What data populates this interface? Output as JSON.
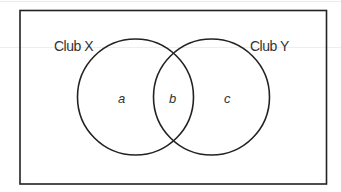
{
  "diagram": {
    "type": "venn",
    "universe_box": {
      "stroke": "#222222"
    },
    "sets": [
      {
        "id": "X",
        "label": "Club X"
      },
      {
        "id": "Y",
        "label": "Club Y"
      }
    ],
    "regions": [
      {
        "id": "only_X",
        "label": "a"
      },
      {
        "id": "X_and_Y",
        "label": "b"
      },
      {
        "id": "only_Y",
        "label": "c"
      }
    ],
    "stroke_color": "#222222",
    "text_color": "#333333"
  }
}
